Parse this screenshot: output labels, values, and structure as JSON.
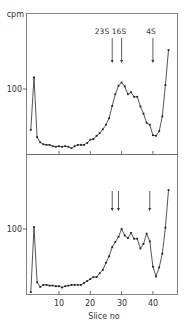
{
  "chart_data": {
    "type": "line",
    "ylabel": "cpm",
    "xlabel": "Slice no",
    "x_ticks": [
      10,
      20,
      30,
      40
    ],
    "y_ticks": [
      100
    ],
    "xlim": [
      0,
      48
    ],
    "ylim": [
      0,
      210
    ],
    "grid": false,
    "legend": "none",
    "panels": [
      {
        "name": "top",
        "annotations": [
          {
            "label": "23S",
            "slice": 27
          },
          {
            "label": "16S",
            "slice": 30
          },
          {
            "label": "4S",
            "slice": 40
          }
        ],
        "x": [
          1,
          2,
          3,
          4,
          5,
          6,
          7,
          8,
          9,
          10,
          11,
          12,
          13,
          14,
          15,
          16,
          17,
          18,
          19,
          20,
          21,
          22,
          23,
          24,
          25,
          26,
          27,
          28,
          29,
          30,
          31,
          32,
          33,
          34,
          35,
          36,
          37,
          38,
          39,
          40,
          41,
          42,
          43,
          44,
          45
        ],
        "values": [
          37,
          118,
          26,
          18,
          15,
          14,
          14,
          12,
          11,
          12,
          11,
          12,
          11,
          9,
          12,
          14,
          14,
          14,
          17,
          22,
          23,
          28,
          32,
          38,
          45,
          55,
          74,
          92,
          105,
          110,
          104,
          92,
          95,
          88,
          88,
          73,
          62,
          48,
          45,
          29,
          28,
          35,
          58,
          106,
          160
        ]
      },
      {
        "name": "bottom",
        "annotations": [
          {
            "label": "",
            "slice": 27
          },
          {
            "label": "",
            "slice": 29
          },
          {
            "label": "",
            "slice": 39
          }
        ],
        "x": [
          1,
          2,
          3,
          4,
          5,
          6,
          7,
          8,
          9,
          10,
          11,
          12,
          13,
          14,
          15,
          16,
          17,
          18,
          19,
          20,
          21,
          22,
          23,
          24,
          25,
          26,
          27,
          28,
          29,
          30,
          31,
          32,
          33,
          34,
          35,
          36,
          37,
          38,
          39,
          40,
          41,
          42,
          43,
          44,
          45
        ],
        "values": [
          3,
          103,
          18,
          11,
          14,
          14,
          13,
          13,
          12,
          12,
          10,
          12,
          13,
          14,
          14,
          14,
          14,
          17,
          20,
          23,
          26,
          26,
          32,
          37,
          48,
          58,
          72,
          80,
          88,
          100,
          90,
          86,
          94,
          85,
          85,
          70,
          77,
          93,
          81,
          42,
          27,
          41,
          62,
          102,
          160
        ]
      }
    ]
  },
  "labels": {
    "ylabel": "cpm",
    "xlabel": "Slice no",
    "ytick_top": "100",
    "ytick_bottom": "100",
    "xtick_10": "10",
    "xtick_20": "20",
    "xtick_30": "30",
    "xtick_40": "40",
    "ann_23s": "23S",
    "ann_16s": "16S",
    "ann_4s": "4S"
  },
  "colors": {
    "ink": "#2a2a2a",
    "frame": "#555555",
    "background": "#ffffff"
  }
}
